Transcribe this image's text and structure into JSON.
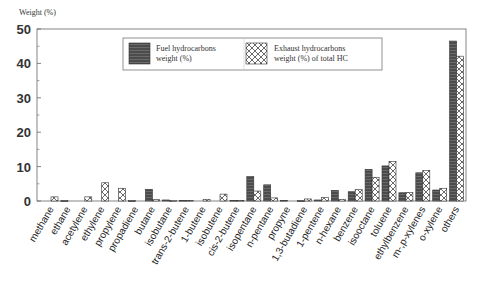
{
  "chart_data": {
    "type": "bar",
    "title": "",
    "xlabel": "",
    "ylabel": "Weight (%)",
    "ylim": [
      0,
      50
    ],
    "yticks": [
      0,
      10,
      20,
      30,
      40,
      50
    ],
    "grid": false,
    "legend_position": "top-center (inside plot)",
    "categories": [
      "methane",
      "ethane",
      "acetylene",
      "ethylene",
      "propylene",
      "propadiene",
      "butane",
      "isobutane",
      "trans-2-butene",
      "1-butene",
      "isobutene",
      "cis-2-butene",
      "isopentane",
      "n-pentane",
      "propyne",
      "1,3-butadiene",
      "1-pentene",
      "n-hexane",
      "benzene",
      "isooctane",
      "toluene",
      "ethylbenzene",
      "m-,p-xylenes",
      "o-xylene",
      "others"
    ],
    "series": [
      {
        "name": "Fuel hydrocarbons weight (%)",
        "pattern": "dark-horizontal-lines",
        "values": [
          0,
          0.1,
          0,
          0,
          0,
          0.1,
          3.4,
          0.3,
          0.2,
          0,
          0,
          0.2,
          7.1,
          4.7,
          0.2,
          0.1,
          0.3,
          3.1,
          2.7,
          9.2,
          10.2,
          2.4,
          8.2,
          3.2,
          46.5
        ]
      },
      {
        "name": "Exhaust hydrocarbons weight (%) of total HC",
        "pattern": "crosshatch",
        "values": [
          1.2,
          0,
          1.2,
          5.3,
          3.7,
          0,
          0.4,
          0.1,
          0.2,
          0.5,
          2.0,
          0.2,
          2.9,
          0.9,
          0,
          0.6,
          1.0,
          0.5,
          3.3,
          6.9,
          11.5,
          2.5,
          8.9,
          3.7,
          42.1
        ]
      }
    ]
  },
  "legend": {
    "fuel_line1": "Fuel hydrocarbons",
    "fuel_line2": "weight (%)",
    "exhaust_line1": "Exhaust hydrocarbons",
    "exhaust_line2": "weight (%) of total HC"
  }
}
